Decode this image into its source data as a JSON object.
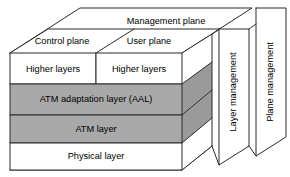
{
  "diagram": {
    "top_plane": {
      "label": "Management plane"
    },
    "planes": [
      {
        "id": "control",
        "label": "Control plane"
      },
      {
        "id": "user",
        "label": "User plane"
      }
    ],
    "layers": [
      {
        "id": "higher-layers-control",
        "label": "Higher layers",
        "fill": "#ffffff"
      },
      {
        "id": "higher-layers-user",
        "label": "Higher layers",
        "fill": "#ffffff"
      },
      {
        "id": "aal",
        "label": "ATM adaptation layer (AAL)",
        "fill": "#a9a9a9"
      },
      {
        "id": "atm",
        "label": "ATM layer",
        "fill": "#a9a9a9"
      },
      {
        "id": "physical",
        "label": "Physical layer",
        "fill": "#ffffff"
      }
    ],
    "side_panels": [
      {
        "id": "layer-management",
        "label": "Layer management"
      },
      {
        "id": "plane-management",
        "label": "Plane management"
      }
    ],
    "colors": {
      "fill_white": "#ffffff",
      "fill_gray": "#a9a9a9",
      "fill_gray_dark": "#9a9a9a",
      "fill_gray_top": "#b4b4b4",
      "stroke": "#2b2b2b",
      "text": "#000000",
      "background": "#ffffff"
    }
  }
}
